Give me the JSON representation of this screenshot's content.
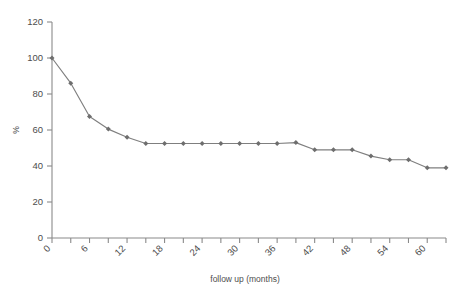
{
  "chart_data": {
    "type": "line",
    "title": "",
    "subtitle": "",
    "xlabel": "follow up (months)",
    "ylabel": "%",
    "xlim": [
      0,
      63
    ],
    "ylim": [
      0,
      120
    ],
    "grid": false,
    "legend": null,
    "marker": "diamond",
    "series_color": "#7f7f7f",
    "ytick_labels": [
      "0",
      "20",
      "40",
      "60",
      "80",
      "100",
      "120"
    ],
    "ytick_values": [
      0,
      20,
      40,
      60,
      80,
      100,
      120
    ],
    "xtick_labels": [
      "0",
      "6",
      "12",
      "18",
      "24",
      "30",
      "36",
      "42",
      "48",
      "54",
      "60"
    ],
    "xtick_values": [
      0,
      6,
      12,
      18,
      24,
      30,
      36,
      42,
      48,
      54,
      60
    ],
    "xtick_minor_values": [
      3,
      9,
      15,
      21,
      27,
      33,
      39,
      45,
      51,
      57,
      63
    ],
    "x": [
      0,
      3,
      6,
      9,
      12,
      15,
      18,
      21,
      24,
      27,
      30,
      33,
      36,
      39,
      42,
      45,
      48,
      51,
      54,
      57,
      60,
      63
    ],
    "values": [
      100,
      86,
      67.5,
      60.5,
      56,
      52.5,
      52.5,
      52.5,
      52.5,
      52.5,
      52.5,
      52.5,
      52.5,
      53,
      49,
      49,
      49,
      45.5,
      43.5,
      43.5,
      39,
      39
    ],
    "series": [
      {
        "name": "survival",
        "values": [
          100,
          86,
          67.5,
          60.5,
          56,
          52.5,
          52.5,
          52.5,
          52.5,
          52.5,
          52.5,
          52.5,
          52.5,
          53,
          49,
          49,
          49,
          45.5,
          43.5,
          43.5,
          39,
          39
        ]
      }
    ],
    "annotations": []
  },
  "figure": {
    "name": "follow-up-survival-curve"
  }
}
